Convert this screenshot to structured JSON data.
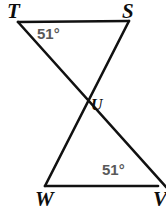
{
  "figure": {
    "type": "geometry-diagram",
    "background_color": "#ffffff",
    "stroke_color": "#111111",
    "stroke_width": 2.6,
    "angle_label_color": "#595959",
    "vertex_label_color": "#0d0d0d",
    "vertices": [
      {
        "id": "T",
        "label": "T",
        "x": 18,
        "y": 22,
        "label_x": 7,
        "label_y": 1
      },
      {
        "id": "S",
        "label": "S",
        "x": 129,
        "y": 21,
        "label_x": 122,
        "label_y": 1
      },
      {
        "id": "U",
        "label": "U",
        "x": 81,
        "y": 103,
        "label_x": 91,
        "label_y": 97
      },
      {
        "id": "W",
        "label": "W",
        "x": 45,
        "y": 186,
        "label_x": 35,
        "label_y": 189
      },
      {
        "id": "V",
        "label": "V",
        "x": 156,
        "y": 186,
        "label_x": 153,
        "label_y": 189
      }
    ],
    "segments": [
      {
        "name": "segment-TS",
        "from": "T",
        "to": "S"
      },
      {
        "name": "segment-TV",
        "from": "T",
        "to": "V"
      },
      {
        "name": "segment-SW",
        "from": "S",
        "to": "W"
      },
      {
        "name": "segment-WV",
        "from": "W",
        "to": "V"
      }
    ],
    "angles": [
      {
        "name": "angle-at-T",
        "at": "T",
        "value": "51°",
        "label_x": 37,
        "label_y": 26
      },
      {
        "name": "angle-at-V",
        "at": "V",
        "value": "51°",
        "label_x": 102,
        "label_y": 162
      }
    ]
  }
}
